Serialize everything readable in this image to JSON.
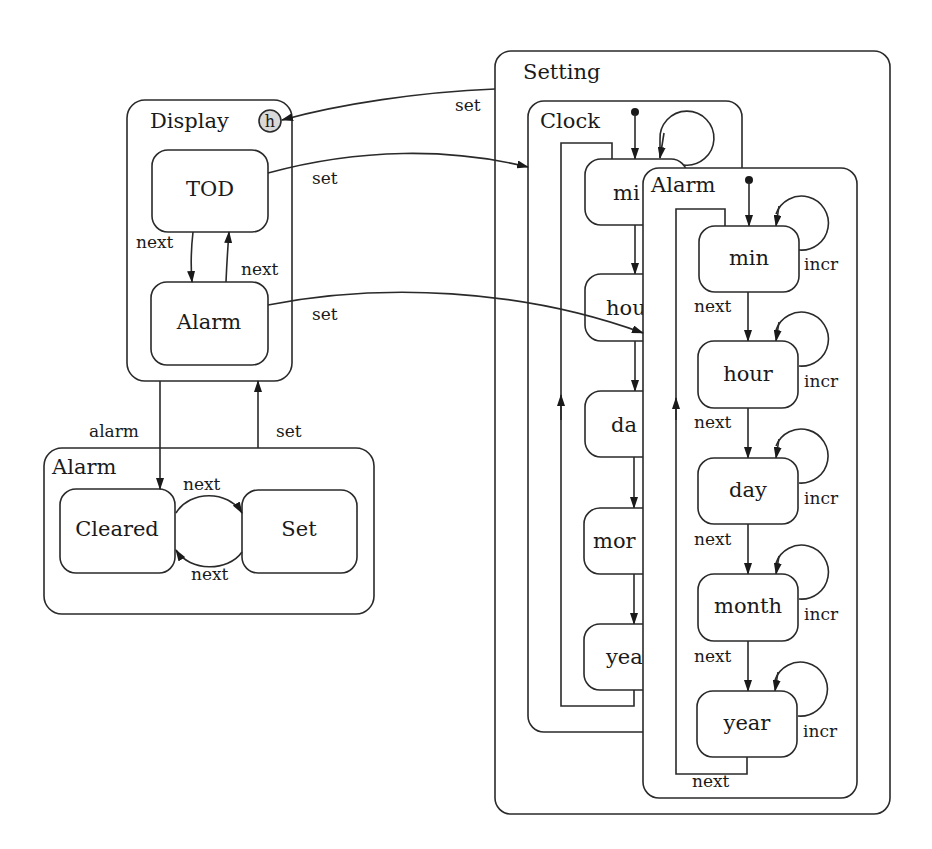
{
  "diagram": {
    "containers": {
      "display": {
        "label": "Display",
        "history_marker": "h"
      },
      "alarm_mode": {
        "label": "Alarm"
      },
      "setting": {
        "label": "Setting"
      },
      "clock": {
        "label": "Clock"
      },
      "alarm_setting": {
        "label": "Alarm"
      }
    },
    "states": {
      "tod": "TOD",
      "display_alarm": "Alarm",
      "cleared": "Cleared",
      "set": "Set",
      "clock_min": "mi",
      "clock_hour": "hou",
      "clock_day": "da",
      "clock_month": "mor",
      "clock_year": "yea",
      "alarm_min": "min",
      "alarm_hour": "hour",
      "alarm_day": "day",
      "alarm_month": "month",
      "alarm_year": "year"
    },
    "transitions": {
      "setting_to_display": "set",
      "tod_to_clock": "set",
      "alarm_to_alarm_setting": "set",
      "tod_to_alarm": "next",
      "alarm_to_tod": "next",
      "display_to_alarm_mode": "alarm",
      "alarm_mode_to_display": "set",
      "cleared_to_set": "next",
      "set_to_cleared": "next",
      "alarm_min_next": "next",
      "alarm_hour_next": "next",
      "alarm_day_next": "next",
      "alarm_month_next": "next",
      "alarm_year_next": "next",
      "incr_min": "incr",
      "incr_hour": "incr",
      "incr_day": "incr",
      "incr_month": "incr",
      "incr_year": "incr"
    }
  }
}
